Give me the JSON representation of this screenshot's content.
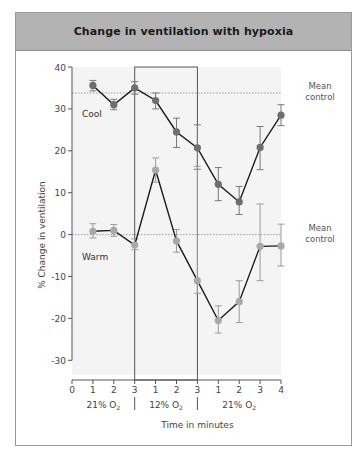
{
  "title": "Change in ventilation with hypoxia",
  "chart_data": {
    "type": "line",
    "title": "Change in ventilation with hypoxia",
    "xlabel": "Time in minutes",
    "ylabel": "% Change in ventilation",
    "ylim": [
      -30,
      40
    ],
    "yticks": [
      40,
      30,
      20,
      10,
      0,
      -10,
      -20,
      -30
    ],
    "x_tick_labels": [
      "0",
      "1",
      "2",
      "3",
      "1",
      "2",
      "3",
      "1",
      "2",
      "3",
      "4"
    ],
    "phases": [
      {
        "label": "21% O2",
        "label_main": "21% O",
        "sub": "2",
        "from_tick": 0,
        "to_tick": 3
      },
      {
        "label": "12% O2",
        "label_main": "12% O",
        "sub": "2",
        "from_tick": 3,
        "to_tick": 6,
        "highlighted": true
      },
      {
        "label": "21% O2",
        "label_main": "21% O",
        "sub": "2",
        "from_tick": 6,
        "to_tick": 10
      }
    ],
    "x_positions": [
      1,
      2,
      3,
      4,
      5,
      6,
      7,
      8,
      9,
      10
    ],
    "series": [
      {
        "name": "Cool",
        "values": [
          35.6,
          31.0,
          35.0,
          32.0,
          24.5,
          20.7,
          12.0,
          7.8,
          20.8,
          28.5
        ],
        "err_hi": [
          36.8,
          32.3,
          36.5,
          33.8,
          27.8,
          26.2,
          16.0,
          11.5,
          25.8,
          31.0
        ],
        "err_lo": [
          34.3,
          29.8,
          33.5,
          30.0,
          20.8,
          15.6,
          8.1,
          4.8,
          15.5,
          26.0
        ],
        "mean_control": 33.8,
        "color": "#6e6e6e"
      },
      {
        "name": "Warm",
        "values": [
          0.8,
          1.0,
          -2.5,
          15.4,
          -1.5,
          -11.0,
          -20.5,
          -16.0,
          -2.8,
          -2.7
        ],
        "err_hi": [
          2.6,
          2.4,
          -1.0,
          18.3,
          1.2,
          16.3,
          -17.0,
          -11.0,
          7.3,
          2.5
        ],
        "err_lo": [
          -0.8,
          -0.4,
          -3.6,
          12.5,
          -4.2,
          -14.0,
          -23.5,
          -21.0,
          -11.0,
          -7.5
        ],
        "mean_control": 0,
        "color": "#a8a8a8"
      }
    ],
    "annotations": [
      {
        "text_line1": "Mean",
        "text_line2": "control",
        "y": 33.8
      },
      {
        "text_line1": "Mean",
        "text_line2": "control",
        "y": 0
      }
    ],
    "grid": false,
    "legend": "inline labels"
  }
}
